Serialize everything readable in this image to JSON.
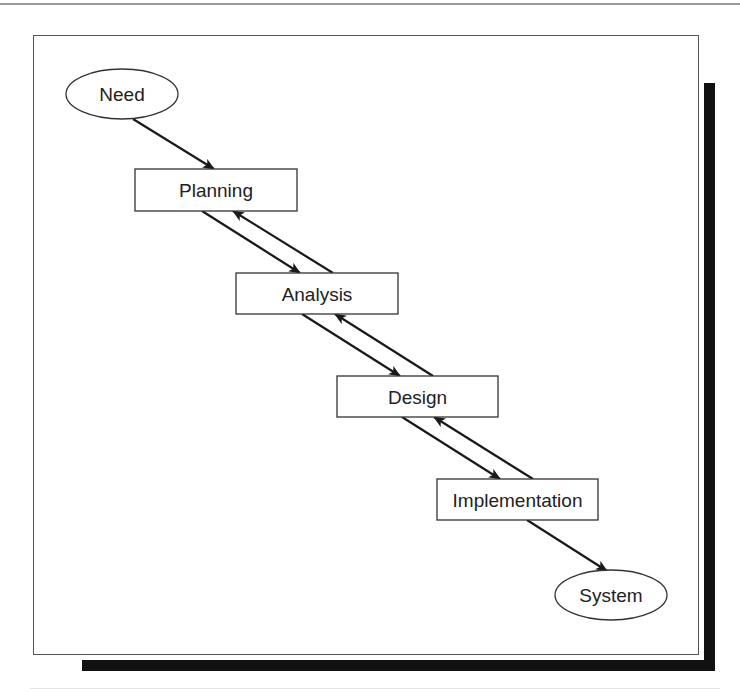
{
  "diagram": {
    "type": "waterfall-flow",
    "nodes": [
      {
        "id": "need",
        "label": "Need",
        "shape": "ellipse",
        "cx": 122,
        "cy": 94,
        "rx": 56,
        "ry": 25
      },
      {
        "id": "planning",
        "label": "Planning",
        "shape": "rect",
        "x": 135,
        "y": 169,
        "w": 162,
        "h": 42
      },
      {
        "id": "analysis",
        "label": "Analysis",
        "shape": "rect",
        "x": 236,
        "y": 273,
        "w": 162,
        "h": 41
      },
      {
        "id": "design",
        "label": "Design",
        "shape": "rect",
        "x": 337,
        "y": 376,
        "w": 161,
        "h": 41
      },
      {
        "id": "implementation",
        "label": "Implementation",
        "shape": "rect",
        "x": 437,
        "y": 479,
        "w": 161,
        "h": 41
      },
      {
        "id": "system",
        "label": "System",
        "shape": "ellipse",
        "cx": 611,
        "cy": 595,
        "rx": 56,
        "ry": 25
      }
    ],
    "edges": [
      {
        "from": "need",
        "to": "planning",
        "x1": 133,
        "y1": 119,
        "x2": 214,
        "y2": 169
      },
      {
        "from": "planning",
        "to": "analysis",
        "x1": 202,
        "y1": 211,
        "x2": 300,
        "y2": 273
      },
      {
        "from": "analysis",
        "to": "planning",
        "x1": 333,
        "y1": 273,
        "x2": 233,
        "y2": 211
      },
      {
        "from": "analysis",
        "to": "design",
        "x1": 302,
        "y1": 314,
        "x2": 400,
        "y2": 376
      },
      {
        "from": "design",
        "to": "analysis",
        "x1": 433,
        "y1": 376,
        "x2": 335,
        "y2": 314
      },
      {
        "from": "design",
        "to": "implementation",
        "x1": 402,
        "y1": 417,
        "x2": 500,
        "y2": 479
      },
      {
        "from": "implementation",
        "to": "design",
        "x1": 533,
        "y1": 479,
        "x2": 434,
        "y2": 417
      },
      {
        "from": "implementation",
        "to": "system",
        "x1": 527,
        "y1": 520,
        "x2": 607,
        "y2": 571
      }
    ]
  },
  "colors": {
    "stroke": "#333333",
    "arrow": "#1a1a1a",
    "shadow": "#111111",
    "text": "#222222"
  }
}
